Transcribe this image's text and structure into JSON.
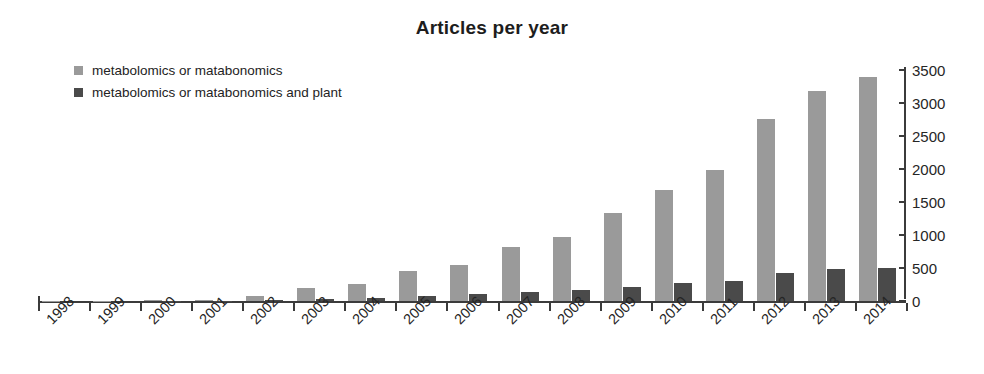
{
  "chart_data": {
    "type": "bar",
    "title": "Articles per year",
    "xlabel": "",
    "ylabel": "",
    "ylim": [
      0,
      3500
    ],
    "ytick_step": 500,
    "yticks": [
      0,
      500,
      1000,
      1500,
      2000,
      2500,
      3000,
      3500
    ],
    "grid": false,
    "legend_position": "top-left",
    "y_axis_side": "right",
    "x_tick_label_rotation": -45,
    "categories": [
      "1998",
      "1999",
      "2000",
      "2001",
      "2002",
      "2003",
      "2004",
      "2005",
      "2006",
      "2007",
      "2008",
      "2009",
      "2010",
      "2011",
      "2012",
      "2013",
      "2014"
    ],
    "series": [
      {
        "name": "metabolomics or matabonomics",
        "color": "#9a9a9a",
        "values": [
          2,
          5,
          10,
          20,
          70,
          190,
          260,
          450,
          540,
          820,
          970,
          1330,
          1680,
          1990,
          2760,
          3180,
          3400
        ]
      },
      {
        "name": "metabolomics or matabonomics and plant",
        "color": "#4a4a4a",
        "values": [
          0,
          0,
          2,
          4,
          8,
          30,
          40,
          80,
          110,
          140,
          165,
          215,
          270,
          300,
          430,
          490,
          500
        ]
      }
    ]
  },
  "colors": {
    "series_light": "#9a9a9a",
    "series_dark": "#4a4a4a",
    "axis": "#3b3b3b",
    "text": "#1d1d1d",
    "background": "#ffffff"
  },
  "legend": {
    "items": [
      {
        "label": "metabolomics or matabonomics",
        "color": "#9a9a9a"
      },
      {
        "label": "metabolomics or matabonomics and plant",
        "color": "#4a4a4a"
      }
    ]
  }
}
